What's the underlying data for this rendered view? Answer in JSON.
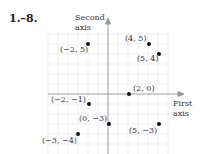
{
  "exercise": {
    "number_label": "1.–8."
  },
  "axes": {
    "vertical_label_line1": "Second",
    "vertical_label_line2": "axis",
    "horizontal_label_line1": "First",
    "horizontal_label_line2": "axis"
  },
  "points": [
    {
      "label": "(−2, 5)",
      "x": -2,
      "y": 5
    },
    {
      "label": "(4, 5)",
      "x": 4,
      "y": 5
    },
    {
      "label": "(5, 4)",
      "x": 5,
      "y": 4
    },
    {
      "label": "(2, 0)",
      "x": 2,
      "y": 0
    },
    {
      "label": "(−2, −1)",
      "x": -2,
      "y": -1
    },
    {
      "label": "(0, −3)",
      "x": 0,
      "y": -3
    },
    {
      "label": "(5, −3)",
      "x": 5,
      "y": -3
    },
    {
      "label": "(−3, −4)",
      "x": -3,
      "y": -4
    }
  ],
  "colors": {
    "grid": "#e6e6e6",
    "axis": "#999999",
    "point": "#111111"
  }
}
